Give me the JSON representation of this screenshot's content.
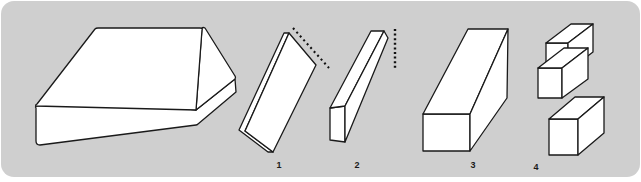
{
  "figure": {
    "panel": {
      "background_color": "#cfcfcf",
      "corner_radius": 12,
      "outer_background_color": "#ffffff",
      "x": 1,
      "y": 1,
      "width": 639,
      "height": 176
    },
    "style": {
      "face_fill": "#ffffff",
      "stroke_color": "#1a1a1a",
      "stroke_width": 1.3,
      "dotted_color": "#111111",
      "label_color": "#1a1a1a",
      "label_font_size": 9
    },
    "shapes": [
      {
        "id": "solid-block",
        "name": "large-solid-block",
        "label": "",
        "description": "Large uncut rectangular block shown in oblique projection with rounded edges"
      },
      {
        "id": "shape-1",
        "name": "thin-flat-slab",
        "label": "1",
        "description": "Thin flat slab cut from the block, tilted, with a diagonal dotted cut line",
        "cut_line": "diagonal-dotted"
      },
      {
        "id": "shape-2",
        "name": "narrow-bar",
        "label": "2",
        "description": "Narrow bar cut from the slab, with a vertical dotted cut line",
        "cut_line": "vertical-dotted"
      },
      {
        "id": "shape-3",
        "name": "square-bar",
        "label": "3",
        "description": "Thicker square-section bar"
      },
      {
        "id": "shape-4",
        "name": "stacked-cubes",
        "label": "4",
        "description": "Three cubes stacked in a diagonal staircase arrangement",
        "cube_count": 3
      }
    ],
    "labels": [
      {
        "text": "1",
        "x": 279,
        "y": 163
      },
      {
        "text": "2",
        "x": 357,
        "y": 163
      },
      {
        "text": "3",
        "x": 473,
        "y": 163
      },
      {
        "text": "4",
        "x": 536,
        "y": 164
      }
    ]
  }
}
